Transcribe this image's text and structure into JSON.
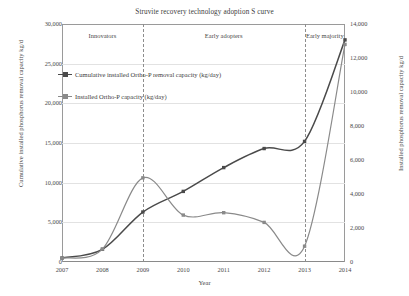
{
  "chart_data": {
    "type": "line",
    "title": "Struvite recovery technology adoption S curve",
    "xlabel": "Year",
    "ylabel": "Cumulative installed phosphorus removal capacity kg/d",
    "y2label": "Installed phosphorus removal capacity kg/d",
    "x": [
      2007,
      2008,
      2009,
      2010,
      2011,
      2012,
      2013,
      2014
    ],
    "xlim": [
      2007,
      2014
    ],
    "xticklabels": [
      "2007",
      "2008",
      "2009",
      "2010",
      "2011",
      "2012",
      "2013",
      "2014"
    ],
    "ylim": [
      0,
      30000
    ],
    "yticklabels": [
      "0",
      "5,000",
      "10,000",
      "15,000",
      "20,000",
      "25,000",
      "30,000"
    ],
    "yticks": [
      0,
      5000,
      10000,
      15000,
      20000,
      25000,
      30000
    ],
    "y2lim": [
      0,
      14000
    ],
    "y2ticklabels": [
      "0",
      "2,000",
      "4,000",
      "6,000",
      "8,000",
      "10,000",
      "12,000",
      "14,000"
    ],
    "y2ticks": [
      0,
      2000,
      4000,
      6000,
      8000,
      10000,
      12000,
      14000
    ],
    "grid": true,
    "legend_position": "upper left",
    "series": [
      {
        "name": "Cumulative installed Ortho-P removal capacity (kg/day)",
        "axis": "left",
        "color": "#4a4a4a",
        "values": [
          500,
          1600,
          6300,
          8900,
          11900,
          14300,
          15200,
          28000
        ]
      },
      {
        "name": "Installed Ortho-P capacity (kg/day)",
        "axis": "right",
        "color": "#8a8a8a",
        "values": [
          230,
          760,
          4950,
          2760,
          2900,
          2330,
          930,
          12800
        ]
      }
    ],
    "annotations": [
      {
        "label": "Innovators",
        "x_center": 2008.0
      },
      {
        "label": "Early adopters",
        "x_center": 2011.0
      },
      {
        "label": "Early majority",
        "x_center": 2013.5
      }
    ],
    "separators": [
      2009,
      2013
    ]
  },
  "legend": {
    "items": [
      {
        "label": "Cumulative installed Ortho-P removal capacity (kg/day)",
        "color": "#4a4a4a"
      },
      {
        "label": "Installed Ortho-P capacity (kg/day)",
        "color": "#8a8a8a"
      }
    ]
  }
}
